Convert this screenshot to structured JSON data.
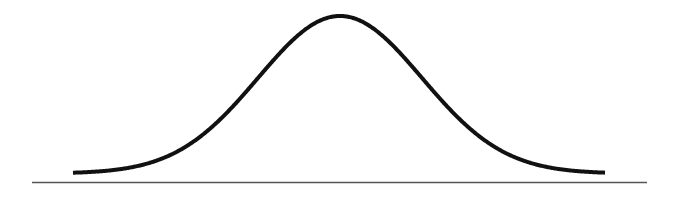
{
  "colors": {
    "curve": "#111111",
    "baseline": "#555555",
    "background": "#ffffff"
  },
  "curve": {
    "type": "gaussian",
    "x_start": 73,
    "x_end": 605,
    "peak_x": 340,
    "peak_y": 16,
    "tail_y": 173.5,
    "sigma_px": 82,
    "stroke_width": 4
  },
  "baseline": {
    "x1": 32,
    "x2": 647,
    "y": 182.5,
    "stroke_width": 1.5
  }
}
